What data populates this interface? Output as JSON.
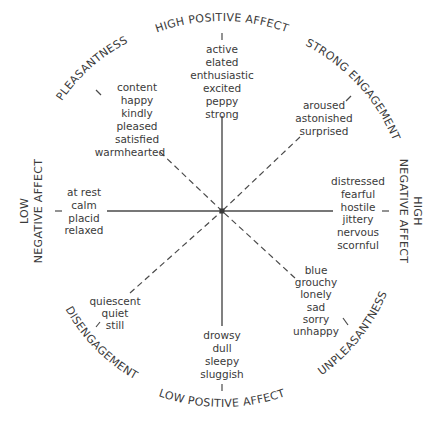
{
  "diagram": {
    "octants": {
      "high_positive_affect": {
        "label": "HIGH POSITIVE AFFECT",
        "words": [
          "active",
          "elated",
          "enthusiastic",
          "excited",
          "peppy",
          "strong"
        ]
      },
      "strong_engagement": {
        "label": "STRONG ENGAGEMENT",
        "words": [
          "aroused",
          "astonished",
          "surprised"
        ]
      },
      "high_negative_affect": {
        "label_line1": "HIGH",
        "label_line2": "NEGATIVE AFFECT",
        "words": [
          "distressed",
          "fearful",
          "hostile",
          "jittery",
          "nervous",
          "scornful"
        ]
      },
      "unpleasantness": {
        "label": "UNPLEASANTNESS",
        "words": [
          "blue",
          "grouchy",
          "lonely",
          "sad",
          "sorry",
          "unhappy"
        ]
      },
      "low_positive_affect": {
        "label": "LOW POSITIVE AFFECT",
        "words": [
          "drowsy",
          "dull",
          "sleepy",
          "sluggish"
        ]
      },
      "disengagement": {
        "label": "DISENGAGEMENT",
        "words": [
          "quiescent",
          "quiet",
          "still"
        ]
      },
      "low_negative_affect": {
        "label_line1": "LOW",
        "label_line2": "NEGATIVE AFFECT",
        "words": [
          "at rest",
          "calm",
          "placid",
          "relaxed"
        ]
      },
      "pleasantness": {
        "label": "PLEASANTNESS",
        "words": [
          "content",
          "happy",
          "kindly",
          "pleased",
          "satisfied",
          "warmhearted"
        ]
      }
    },
    "colors": {
      "ink": "#3a3a3a",
      "background": "#ffffff"
    }
  }
}
